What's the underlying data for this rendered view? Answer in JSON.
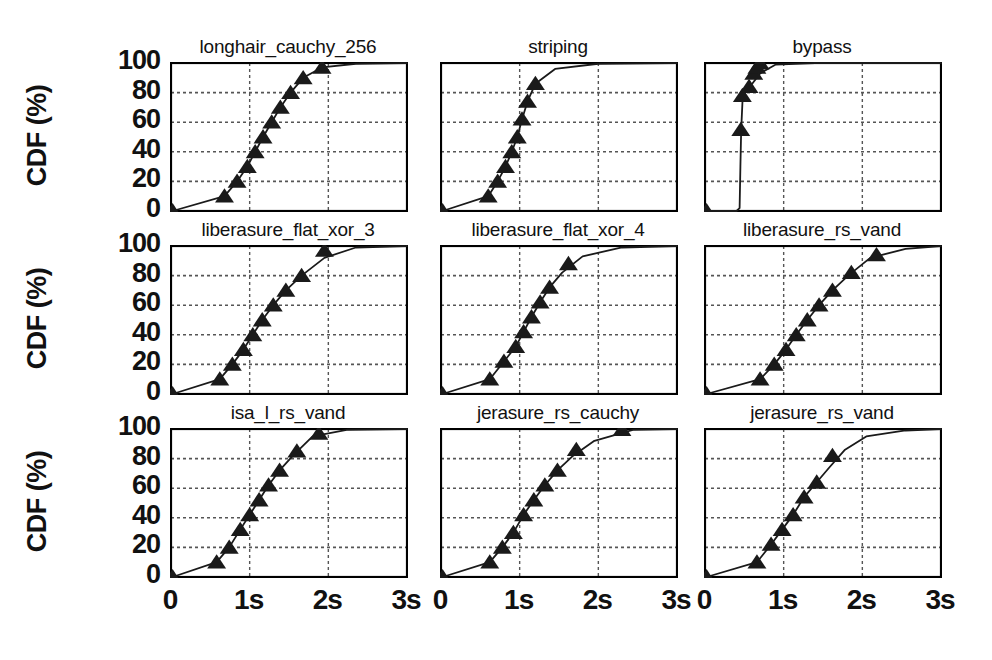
{
  "figure": {
    "ylabel": "CDF (%)",
    "yticks": [
      "100",
      "80",
      "60",
      "40",
      "20",
      "0"
    ],
    "xticks": [
      "0",
      "1s",
      "2s",
      "3s"
    ],
    "rows": 3,
    "cols": 3,
    "line_color": "#1a1a1a",
    "marker_color": "#1a1a1a",
    "grid_color": "#555555",
    "axis_color": "#000000",
    "background": "#ffffff"
  },
  "chart_data": {
    "type": "line",
    "title": "",
    "xlabel": "",
    "ylabel": "CDF (%)",
    "xlim": [
      0,
      3
    ],
    "ylim": [
      0,
      100
    ],
    "xtick_values": [
      0,
      1,
      2,
      3
    ],
    "xtick_labels": [
      "0",
      "1s",
      "2s",
      "3s"
    ],
    "ytick_values": [
      0,
      20,
      40,
      60,
      80,
      100
    ],
    "ytick_labels": [
      "0",
      "20",
      "40",
      "60",
      "80",
      "100"
    ],
    "grid": "horizontal dashed at 20,40,60,80; vertical dashed at 1s,2s",
    "legend": "none",
    "marker": "triangle-up",
    "panels": [
      {
        "title": "longhair_cauchy_256",
        "row": 0,
        "col": 0,
        "x": [
          0.02,
          0.68,
          0.84,
          0.97,
          1.07,
          1.17,
          1.28,
          1.39,
          1.52,
          1.68,
          1.92,
          2.35,
          3.0
        ],
        "y": [
          0,
          10,
          20,
          30,
          40,
          50,
          60,
          70,
          80,
          90,
          97,
          99.5,
          100
        ],
        "markers_x": [
          0.02,
          0.68,
          0.84,
          0.97,
          1.07,
          1.17,
          1.28,
          1.39,
          1.52,
          1.68,
          1.92
        ],
        "markers_y": [
          0,
          10,
          20,
          30,
          40,
          50,
          60,
          70,
          80,
          90,
          97
        ]
      },
      {
        "title": "striping",
        "row": 0,
        "col": 1,
        "x": [
          0.02,
          0.6,
          0.72,
          0.82,
          0.9,
          0.97,
          1.03,
          1.1,
          1.2,
          1.45,
          2.0,
          3.0
        ],
        "y": [
          0,
          10,
          20,
          30,
          40,
          50,
          62,
          74,
          86,
          96,
          99.5,
          100
        ],
        "markers_x": [
          0.02,
          0.6,
          0.72,
          0.82,
          0.9,
          0.97,
          1.03,
          1.1,
          1.2
        ],
        "markers_y": [
          0,
          10,
          20,
          30,
          40,
          50,
          62,
          74,
          86
        ]
      },
      {
        "title": "bypass",
        "row": 0,
        "col": 2,
        "x": [
          0.02,
          0.4,
          0.44,
          0.45,
          0.46,
          0.48,
          0.52,
          0.6,
          0.7,
          0.9,
          1.4,
          3.0
        ],
        "y": [
          0,
          0,
          2,
          30,
          55,
          78,
          84,
          86,
          93,
          99,
          100,
          100
        ],
        "markers_x": [
          0.02,
          0.455,
          0.475,
          0.56,
          0.62,
          0.66,
          0.7
        ],
        "markers_y": [
          0,
          55,
          78,
          84,
          93,
          97,
          100
        ]
      },
      {
        "title": "liberasure_flat_xor_3",
        "row": 1,
        "col": 0,
        "x": [
          0.02,
          0.62,
          0.78,
          0.92,
          1.04,
          1.16,
          1.3,
          1.46,
          1.66,
          1.95,
          2.35,
          3.0
        ],
        "y": [
          0,
          10,
          20,
          30,
          40,
          50,
          60,
          70,
          80,
          92,
          99,
          100
        ],
        "markers_x": [
          0.02,
          0.62,
          0.78,
          0.92,
          1.04,
          1.16,
          1.3,
          1.46,
          1.66,
          1.95
        ],
        "markers_y": [
          0,
          10,
          20,
          30,
          40,
          50,
          60,
          70,
          80,
          97
        ]
      },
      {
        "title": "liberasure_flat_xor_4",
        "row": 1,
        "col": 1,
        "x": [
          0.02,
          0.62,
          0.8,
          0.95,
          1.05,
          1.15,
          1.26,
          1.38,
          1.54,
          1.8,
          2.3,
          3.0
        ],
        "y": [
          0,
          10,
          22,
          32,
          42,
          52,
          62,
          72,
          82,
          93,
          99,
          100
        ],
        "markers_x": [
          0.02,
          0.62,
          0.8,
          0.95,
          1.05,
          1.15,
          1.26,
          1.38,
          1.62
        ],
        "markers_y": [
          0,
          10,
          22,
          32,
          42,
          52,
          62,
          72,
          88
        ]
      },
      {
        "title": "liberasure_rs_vand",
        "row": 1,
        "col": 2,
        "x": [
          0.02,
          0.7,
          0.88,
          1.03,
          1.16,
          1.3,
          1.45,
          1.62,
          1.82,
          2.1,
          2.55,
          3.0
        ],
        "y": [
          0,
          10,
          20,
          30,
          40,
          50,
          60,
          70,
          80,
          92,
          98,
          100
        ],
        "markers_x": [
          0.02,
          0.7,
          0.88,
          1.03,
          1.16,
          1.3,
          1.45,
          1.62,
          1.86,
          2.18
        ],
        "markers_y": [
          0,
          10,
          20,
          30,
          40,
          50,
          60,
          70,
          82,
          94
        ]
      },
      {
        "title": "isa_l_rs_vand",
        "row": 2,
        "col": 0,
        "x": [
          0.02,
          0.58,
          0.74,
          0.88,
          1.0,
          1.12,
          1.24,
          1.38,
          1.55,
          1.8,
          2.25,
          3.0
        ],
        "y": [
          0,
          10,
          20,
          32,
          42,
          52,
          62,
          72,
          82,
          95,
          99.5,
          100
        ],
        "markers_x": [
          0.02,
          0.58,
          0.74,
          0.88,
          1.0,
          1.12,
          1.24,
          1.38,
          1.6,
          1.88
        ],
        "markers_y": [
          0,
          10,
          20,
          32,
          42,
          52,
          62,
          72,
          85,
          97
        ]
      },
      {
        "title": "jerasure_rs_cauchy",
        "row": 2,
        "col": 1,
        "x": [
          0.02,
          0.62,
          0.78,
          0.92,
          1.05,
          1.18,
          1.32,
          1.48,
          1.68,
          1.95,
          2.45,
          3.0
        ],
        "y": [
          0,
          10,
          20,
          30,
          42,
          52,
          62,
          72,
          82,
          92,
          99.5,
          100
        ],
        "markers_x": [
          0.02,
          0.62,
          0.78,
          0.92,
          1.05,
          1.18,
          1.32,
          1.48,
          1.72,
          2.3
        ],
        "markers_y": [
          0,
          10,
          20,
          30,
          42,
          52,
          62,
          72,
          86,
          99.5
        ]
      },
      {
        "title": "jerasure_rs_vand",
        "row": 2,
        "col": 2,
        "x": [
          0.02,
          0.66,
          0.84,
          0.98,
          1.12,
          1.26,
          1.42,
          1.58,
          1.78,
          2.05,
          2.55,
          3.0
        ],
        "y": [
          0,
          10,
          22,
          32,
          42,
          54,
          64,
          74,
          86,
          95,
          99,
          100
        ],
        "markers_x": [
          0.02,
          0.66,
          0.84,
          0.98,
          1.12,
          1.26,
          1.42,
          1.62
        ],
        "markers_y": [
          0,
          10,
          22,
          32,
          42,
          54,
          64,
          82
        ]
      }
    ]
  }
}
